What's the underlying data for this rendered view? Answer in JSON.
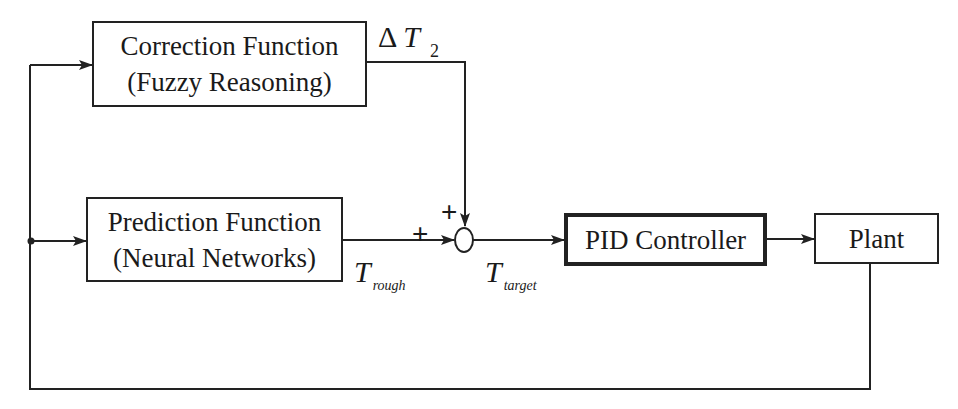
{
  "diagram": {
    "type": "control block diagram",
    "blocks": {
      "correction": {
        "line1": "Correction Function",
        "line2": "(Fuzzy Reasoning)"
      },
      "prediction": {
        "line1": "Prediction Function",
        "line2": "(Neural Networks)"
      },
      "pid": {
        "label": "PID Controller"
      },
      "plant": {
        "label": "Plant"
      }
    },
    "signals": {
      "delta_t2": {
        "delta": "Δ",
        "symbol": "T",
        "sub": "2"
      },
      "t_rough": {
        "symbol": "T",
        "sub": "rough"
      },
      "t_target": {
        "symbol": "T",
        "sub": "target"
      }
    },
    "summing_junction": {
      "input_signs": [
        "+",
        "+"
      ]
    },
    "connections": [
      "Plant output → feedback → Correction Function",
      "Plant output → feedback → Prediction Function",
      "Correction Function → ΔT2 → summing junction (+)",
      "Prediction Function → T_rough → summing junction (+)",
      "summing junction → T_target → PID Controller",
      "PID Controller → Plant"
    ]
  }
}
